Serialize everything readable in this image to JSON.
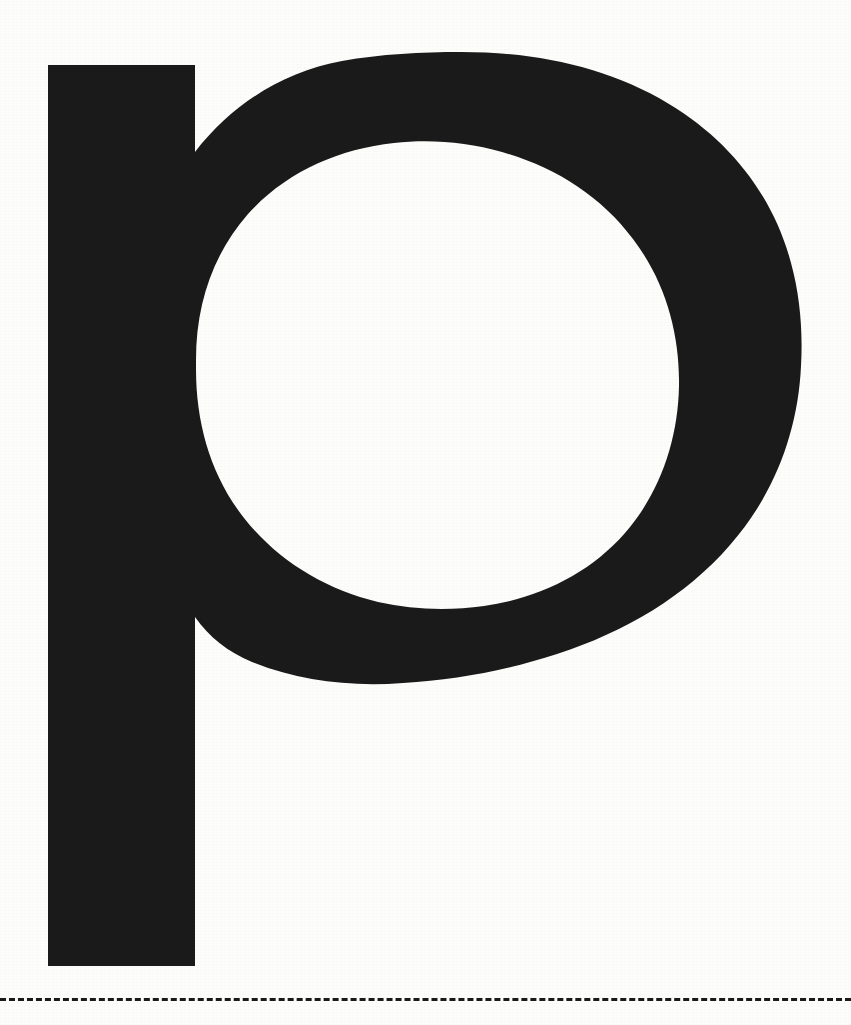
{
  "page": {
    "background_color": "#fdfdfb",
    "width": 851,
    "height": 1025,
    "kind": "type-specimen-sheet"
  },
  "glyph": {
    "character": "p",
    "name": "latin-small-letter-p",
    "icon_name": "letter-p-glyph",
    "style": "grotesque-sans-serif-bold",
    "ink_color": "#1a1a1a",
    "bounds": {
      "left": 48,
      "top": 52,
      "right": 800,
      "bottom": 966
    },
    "stem": {
      "left": 48,
      "top": 65,
      "right": 195,
      "bottom": 966
    },
    "bowl": {
      "left": 150,
      "top": 52,
      "right": 800,
      "bottom": 686
    },
    "counter": {
      "left": 196,
      "top": 128,
      "right": 646,
      "bottom": 608
    }
  },
  "cut_line": {
    "name": "trim-dashed-rule",
    "color": "#1a1a1a",
    "y": 998,
    "thickness": 3,
    "dash_length": 9,
    "gap_length": 5,
    "style": "dashed"
  }
}
